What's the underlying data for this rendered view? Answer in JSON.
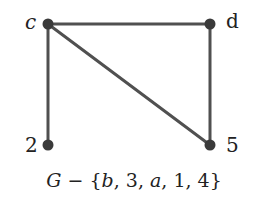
{
  "diagram": {
    "type": "graph",
    "colors": {
      "edge": "#505050",
      "node": "#3a3a3a",
      "text": "#222222",
      "background": "#ffffff"
    },
    "nodes": [
      {
        "id": "c",
        "label": "c",
        "x": 48,
        "y": 24
      },
      {
        "id": "d",
        "label": "d",
        "x": 210,
        "y": 24
      },
      {
        "id": "2",
        "label": "2",
        "x": 48,
        "y": 145
      },
      {
        "id": "5",
        "label": "5",
        "x": 210,
        "y": 145
      }
    ],
    "edges": [
      {
        "from": "c",
        "to": "d"
      },
      {
        "from": "c",
        "to": "2"
      },
      {
        "from": "c",
        "to": "5"
      },
      {
        "from": "d",
        "to": "5"
      }
    ],
    "caption": {
      "graph": "G",
      "operator": "−",
      "removed_set_open": "{",
      "removed": [
        "b",
        "3",
        "a",
        "1",
        "4"
      ],
      "removed_set_close": "}",
      "full_text": "G − {b, 3, a, 1, 4}"
    }
  }
}
